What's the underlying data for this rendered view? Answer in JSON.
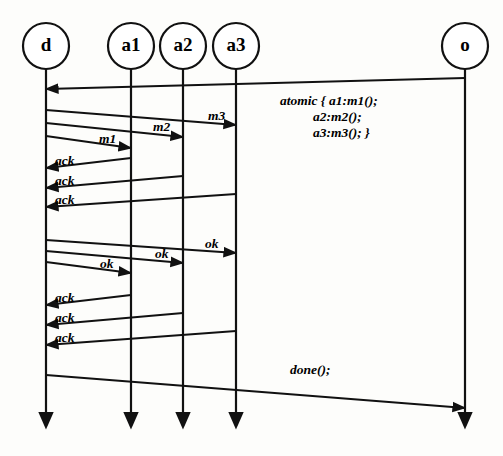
{
  "diagram": {
    "type": "uml-sequence-diagram",
    "canvas": {
      "width": 503,
      "height": 456
    },
    "colors": {
      "stroke": "#111111",
      "fill": "#ffffff",
      "background": "#fdfdfb"
    },
    "lifelines": [
      {
        "id": "d",
        "label": "d",
        "x": 46,
        "circle_cy": 46,
        "circle_r": 23,
        "line_top": 69,
        "line_bottom": 440
      },
      {
        "id": "a1",
        "label": "a1",
        "x": 131,
        "circle_cy": 46,
        "circle_r": 23,
        "line_top": 69,
        "line_bottom": 440
      },
      {
        "id": "a2",
        "label": "a2",
        "x": 183,
        "circle_cy": 46,
        "circle_r": 23,
        "line_top": 69,
        "line_bottom": 440
      },
      {
        "id": "a3",
        "label": "a3",
        "x": 236,
        "circle_cy": 46,
        "circle_r": 23,
        "line_top": 69,
        "line_bottom": 440
      },
      {
        "id": "o",
        "label": "o",
        "x": 465,
        "circle_cy": 46,
        "circle_r": 23,
        "line_top": 69,
        "line_bottom": 440
      }
    ],
    "messages": [
      {
        "id": "msg-atomic-call",
        "label": "",
        "from": "o",
        "to": "d",
        "direction": "left",
        "x1": 465,
        "y1": 78,
        "x2": 46,
        "y2": 89
      },
      {
        "id": "msg-m3",
        "label": "m3",
        "from": "d",
        "to": "a3",
        "direction": "right",
        "x1": 46,
        "y1": 110,
        "x2": 236,
        "y2": 125,
        "label_x": 208,
        "label_y": 120
      },
      {
        "id": "msg-m2",
        "label": "m2",
        "from": "d",
        "to": "a2",
        "direction": "right",
        "x1": 46,
        "y1": 123,
        "x2": 183,
        "y2": 137,
        "label_x": 153,
        "label_y": 131
      },
      {
        "id": "msg-m1",
        "label": "m1",
        "from": "d",
        "to": "a1",
        "direction": "right",
        "x1": 46,
        "y1": 136,
        "x2": 131,
        "y2": 148,
        "label_x": 99,
        "label_y": 143
      },
      {
        "id": "msg-ack-1",
        "label": "ack",
        "from": "a1",
        "to": "d",
        "direction": "left",
        "x1": 131,
        "y1": 158,
        "x2": 46,
        "y2": 168,
        "label_x": 55,
        "label_y": 165
      },
      {
        "id": "msg-ack-2",
        "label": "ack",
        "from": "a2",
        "to": "d",
        "direction": "left",
        "x1": 183,
        "y1": 176,
        "x2": 46,
        "y2": 188,
        "label_x": 55,
        "label_y": 185
      },
      {
        "id": "msg-ack-3",
        "label": "ack",
        "from": "a3",
        "to": "d",
        "direction": "left",
        "x1": 236,
        "y1": 194,
        "x2": 46,
        "y2": 207,
        "label_x": 55,
        "label_y": 204
      },
      {
        "id": "msg-ok-3",
        "label": "ok",
        "from": "d",
        "to": "a3",
        "direction": "right",
        "x1": 46,
        "y1": 240,
        "x2": 236,
        "y2": 253,
        "label_x": 205,
        "label_y": 248
      },
      {
        "id": "msg-ok-2",
        "label": "ok",
        "from": "d",
        "to": "a2",
        "direction": "right",
        "x1": 46,
        "y1": 251,
        "x2": 183,
        "y2": 263,
        "label_x": 155,
        "label_y": 258
      },
      {
        "id": "msg-ok-1",
        "label": "ok",
        "from": "d",
        "to": "a1",
        "direction": "right",
        "x1": 46,
        "y1": 262,
        "x2": 131,
        "y2": 273,
        "label_x": 100,
        "label_y": 268
      },
      {
        "id": "msg-ack-4",
        "label": "ack",
        "from": "a1",
        "to": "d",
        "direction": "left",
        "x1": 131,
        "y1": 295,
        "x2": 46,
        "y2": 305,
        "label_x": 55,
        "label_y": 302
      },
      {
        "id": "msg-ack-5",
        "label": "ack",
        "from": "a2",
        "to": "d",
        "direction": "left",
        "x1": 183,
        "y1": 313,
        "x2": 46,
        "y2": 325,
        "label_x": 55,
        "label_y": 322
      },
      {
        "id": "msg-ack-6",
        "label": "ack",
        "from": "a3",
        "to": "d",
        "direction": "left",
        "x1": 236,
        "y1": 331,
        "x2": 46,
        "y2": 345,
        "label_x": 55,
        "label_y": 342
      },
      {
        "id": "msg-done",
        "label": "done();",
        "from": "d",
        "to": "o",
        "direction": "right",
        "x1": 46,
        "y1": 375,
        "x2": 465,
        "y2": 408,
        "label_x": 290,
        "label_y": 374
      }
    ],
    "note": {
      "id": "atomic-note",
      "x": 280,
      "y": 105,
      "line_height": 16,
      "lines": [
        {
          "text": "atomic { a1:m1();",
          "indent": 0
        },
        {
          "text": "a2:m2();",
          "indent": 33
        },
        {
          "text": "a3:m3(); }",
          "indent": 33
        }
      ]
    }
  }
}
